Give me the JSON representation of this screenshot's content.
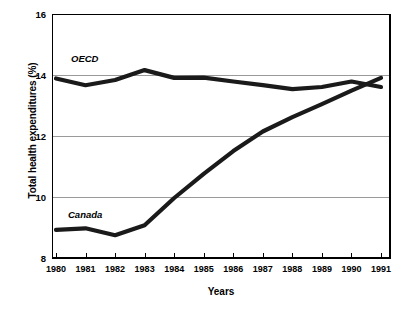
{
  "chart_data": {
    "type": "line",
    "title": "",
    "xlabel": "Years",
    "ylabel": "Total health expenditures (%)",
    "categories": [
      "1980",
      "1981",
      "1982",
      "1983",
      "1984",
      "1985",
      "1986",
      "1987",
      "1988",
      "1989",
      "1990",
      "1991"
    ],
    "x": [
      1980,
      1981,
      1982,
      1983,
      1984,
      1985,
      1986,
      1987,
      1988,
      1989,
      1990,
      1991
    ],
    "xlim": [
      1980,
      1991
    ],
    "ylim": [
      8,
      16
    ],
    "yticks": [
      8,
      10,
      12,
      14,
      16
    ],
    "ytick_labels": [
      "8",
      "10",
      "12",
      "14",
      "16"
    ],
    "grid": true,
    "grid_axis": "y",
    "legend": "inline-labels",
    "line_color": "#1a1a1a",
    "grid_color": "#9a9a9a",
    "axis_color": "#000000",
    "series": [
      {
        "name": "OECD",
        "label_position": "upper-left",
        "values": [
          13.9,
          13.68,
          13.85,
          14.18,
          13.92,
          13.93,
          13.8,
          13.68,
          13.55,
          13.62,
          13.8,
          13.62
        ]
      },
      {
        "name": "Canada",
        "label_position": "lower-left",
        "values": [
          8.9,
          8.95,
          8.72,
          9.05,
          9.95,
          10.75,
          11.5,
          12.15,
          12.62,
          13.05,
          13.5,
          13.92
        ]
      }
    ],
    "annotations": [
      {
        "text": "OECD",
        "x": 1980.6,
        "y": 14.75,
        "style": "italic-bold"
      },
      {
        "text": "Canada",
        "x": 1980.5,
        "y": 9.55,
        "style": "italic-bold"
      }
    ]
  }
}
